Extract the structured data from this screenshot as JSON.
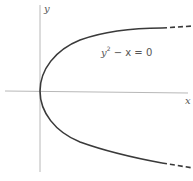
{
  "diagram": {
    "axes": {
      "x_label": "x",
      "y_label": "y"
    },
    "equation": {
      "var": "y",
      "exponent": "2",
      "rest": " − x = 0"
    },
    "colors": {
      "axis": "#b8b8b8",
      "curve": "#3a3a3a",
      "text": "#555555",
      "background": "#ffffff"
    }
  }
}
